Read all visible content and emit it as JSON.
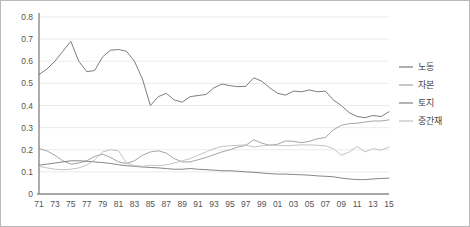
{
  "chart_data": {
    "type": "line",
    "title": "",
    "subtitle": "",
    "xlabel": "",
    "ylabel": "",
    "xlim": [
      1971,
      2015
    ],
    "ylim": [
      0,
      0.8
    ],
    "grid": true,
    "legend_position": "right",
    "y_ticks": [
      "0",
      "0.1",
      "0.2",
      "0.3",
      "0.4",
      "0.5",
      "0.6",
      "0.7",
      "0.8"
    ],
    "y_tick_values": [
      0,
      0.1,
      0.2,
      0.3,
      0.4,
      0.5,
      0.6,
      0.7,
      0.8
    ],
    "x_tick_labels": [
      "71",
      "73",
      "75",
      "77",
      "79",
      "81",
      "83",
      "85",
      "87",
      "89",
      "91",
      "93",
      "95",
      "97",
      "99",
      "01",
      "03",
      "05",
      "07",
      "09",
      "11",
      "13",
      "15"
    ],
    "x_tick_values": [
      1971,
      1973,
      1975,
      1977,
      1979,
      1981,
      1983,
      1985,
      1987,
      1989,
      1991,
      1993,
      1995,
      1997,
      1999,
      2001,
      2003,
      2005,
      2007,
      2009,
      2011,
      2013,
      2015
    ],
    "x": [
      1971,
      1972,
      1973,
      1974,
      1975,
      1976,
      1977,
      1978,
      1979,
      1980,
      1981,
      1982,
      1983,
      1984,
      1985,
      1986,
      1987,
      1988,
      1989,
      1990,
      1991,
      1992,
      1993,
      1994,
      1995,
      1996,
      1997,
      1998,
      1999,
      2000,
      2001,
      2002,
      2003,
      2004,
      2005,
      2006,
      2007,
      2008,
      2009,
      2010,
      2011,
      2012,
      2013,
      2014,
      2015
    ],
    "series": [
      {
        "name": "노동",
        "color": "#6e6e6e",
        "values": [
          0.54,
          0.565,
          0.6,
          0.645,
          0.69,
          0.6,
          0.553,
          0.558,
          0.62,
          0.65,
          0.653,
          0.645,
          0.6,
          0.52,
          0.4,
          0.44,
          0.455,
          0.425,
          0.415,
          0.44,
          0.445,
          0.45,
          0.48,
          0.497,
          0.49,
          0.485,
          0.487,
          0.525,
          0.51,
          0.48,
          0.455,
          0.447,
          0.465,
          0.462,
          0.47,
          0.462,
          0.465,
          0.425,
          0.4,
          0.368,
          0.35,
          0.345,
          0.355,
          0.35,
          0.372
        ]
      },
      {
        "name": "자본",
        "color": "#9a9a9a",
        "values": [
          0.205,
          0.195,
          0.175,
          0.15,
          0.135,
          0.14,
          0.15,
          0.17,
          0.18,
          0.165,
          0.145,
          0.138,
          0.15,
          0.175,
          0.19,
          0.195,
          0.185,
          0.16,
          0.145,
          0.145,
          0.155,
          0.165,
          0.178,
          0.19,
          0.2,
          0.212,
          0.22,
          0.245,
          0.23,
          0.22,
          0.225,
          0.24,
          0.238,
          0.232,
          0.238,
          0.25,
          0.255,
          0.29,
          0.31,
          0.318,
          0.32,
          0.325,
          0.33,
          0.33,
          0.335
        ]
      },
      {
        "name": "토지",
        "color": "#777777",
        "values": [
          0.13,
          0.135,
          0.14,
          0.145,
          0.15,
          0.15,
          0.148,
          0.145,
          0.142,
          0.138,
          0.132,
          0.128,
          0.125,
          0.122,
          0.12,
          0.118,
          0.115,
          0.112,
          0.112,
          0.115,
          0.112,
          0.11,
          0.108,
          0.105,
          0.105,
          0.103,
          0.1,
          0.098,
          0.095,
          0.092,
          0.09,
          0.09,
          0.088,
          0.087,
          0.085,
          0.082,
          0.08,
          0.078,
          0.072,
          0.068,
          0.065,
          0.065,
          0.068,
          0.07,
          0.072
        ]
      },
      {
        "name": "중간재",
        "color": "#bcbcbc",
        "values": [
          0.125,
          0.118,
          0.112,
          0.11,
          0.112,
          0.118,
          0.13,
          0.155,
          0.19,
          0.2,
          0.195,
          0.14,
          0.128,
          0.125,
          0.13,
          0.128,
          0.132,
          0.14,
          0.15,
          0.16,
          0.175,
          0.19,
          0.205,
          0.215,
          0.218,
          0.22,
          0.222,
          0.212,
          0.218,
          0.222,
          0.22,
          0.218,
          0.22,
          0.222,
          0.222,
          0.22,
          0.218,
          0.205,
          0.175,
          0.19,
          0.215,
          0.19,
          0.205,
          0.198,
          0.212
        ]
      }
    ]
  },
  "legend": {
    "items": [
      {
        "label": "노동",
        "color": "#6e6e6e"
      },
      {
        "label": "자본",
        "color": "#9a9a9a"
      },
      {
        "label": "토지",
        "color": "#777777"
      },
      {
        "label": "중간재",
        "color": "#bcbcbc"
      }
    ]
  }
}
